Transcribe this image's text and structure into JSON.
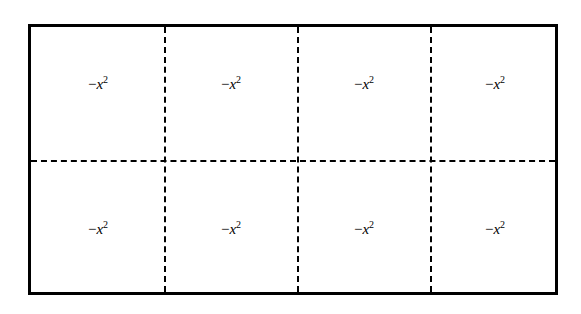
{
  "diagram": {
    "rows": 2,
    "columns": 4,
    "border_color": "#000000",
    "divider_style": "dashed",
    "cells": [
      {
        "sign": "−",
        "var": "x",
        "exp": "2"
      },
      {
        "sign": "−",
        "var": "x",
        "exp": "2"
      },
      {
        "sign": "−",
        "var": "x",
        "exp": "2"
      },
      {
        "sign": "−",
        "var": "x",
        "exp": "2"
      },
      {
        "sign": "−",
        "var": "x",
        "exp": "2"
      },
      {
        "sign": "−",
        "var": "x",
        "exp": "2"
      },
      {
        "sign": "−",
        "var": "x",
        "exp": "2"
      },
      {
        "sign": "−",
        "var": "x",
        "exp": "2"
      }
    ]
  }
}
